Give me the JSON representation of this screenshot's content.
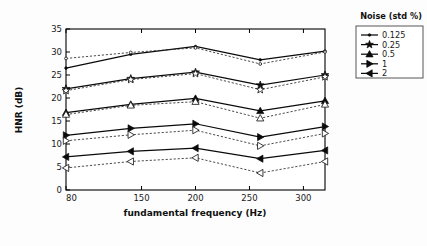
{
  "figure": {
    "background_color": "#fdfdfd",
    "plot_background_color": "#ffffff",
    "axis_color": "#000000"
  },
  "axes": {
    "xlabel": "fundamental frequency (Hz)",
    "ylabel": "HNR (dB)",
    "x_ticks": [
      "80",
      "150",
      "200",
      "250",
      "300"
    ],
    "y_ticks": [
      "0",
      "5",
      "10",
      "15",
      "20",
      "25",
      "30",
      "35"
    ]
  },
  "legend": {
    "title": "Noise (std %)",
    "entries": [
      {
        "label": "0.125",
        "marker": "dot-marker"
      },
      {
        "label": "0.25",
        "marker": "star-marker"
      },
      {
        "label": "0.5",
        "marker": "triangle-up-marker"
      },
      {
        "label": "1",
        "marker": "triangle-right-marker"
      },
      {
        "label": "2",
        "marker": "triangle-left-marker"
      }
    ]
  },
  "chart_data": {
    "type": "line",
    "title": "",
    "xlabel": "fundamental frequency (Hz)",
    "ylabel": "HNR (dB)",
    "xlim": [
      80,
      320
    ],
    "ylim": [
      0,
      35
    ],
    "x_ticks": [
      80,
      150,
      200,
      250,
      300
    ],
    "y_ticks": [
      0,
      5,
      10,
      15,
      20,
      25,
      30,
      35
    ],
    "grid": false,
    "legend_position": "outside-right-top",
    "legend_title": "Noise (std %)",
    "x": [
      80,
      140,
      200,
      260,
      320
    ],
    "series": [
      {
        "name": "0.125",
        "marker": "dot-marker",
        "linestyle": "solid",
        "values": [
          26.5,
          29.5,
          31.2,
          28.3,
          30.2
        ]
      },
      {
        "name": "0.125 (dashed)",
        "marker": "dot-marker",
        "linestyle": "dashed",
        "values": [
          28.6,
          29.9,
          30.9,
          27.4,
          30.0
        ]
      },
      {
        "name": "0.25",
        "marker": "star-marker",
        "linestyle": "solid",
        "values": [
          22.0,
          24.2,
          25.6,
          22.8,
          25.0
        ]
      },
      {
        "name": "0.25 (dashed)",
        "marker": "star-marker",
        "linestyle": "dashed",
        "values": [
          21.6,
          24.0,
          25.3,
          21.8,
          24.6
        ]
      },
      {
        "name": "0.5",
        "marker": "triangle-up-marker",
        "linestyle": "solid",
        "values": [
          16.8,
          18.6,
          19.9,
          17.2,
          19.4
        ]
      },
      {
        "name": "0.5 (dashed)",
        "marker": "triangle-up-marker",
        "linestyle": "dashed",
        "values": [
          16.4,
          18.4,
          19.2,
          15.6,
          18.6
        ]
      },
      {
        "name": "1",
        "marker": "triangle-right-marker",
        "linestyle": "solid",
        "values": [
          11.9,
          13.4,
          14.4,
          11.5,
          13.8
        ]
      },
      {
        "name": "1 (dashed)",
        "marker": "triangle-right-marker",
        "linestyle": "dashed",
        "values": [
          10.7,
          12.0,
          13.0,
          9.6,
          12.3
        ]
      },
      {
        "name": "2",
        "marker": "triangle-left-marker",
        "linestyle": "solid",
        "values": [
          7.2,
          8.4,
          9.1,
          6.8,
          8.6
        ]
      },
      {
        "name": "2 (dashed)",
        "marker": "triangle-left-marker",
        "linestyle": "dashed",
        "values": [
          4.8,
          6.2,
          7.0,
          3.7,
          6.2
        ]
      }
    ]
  }
}
